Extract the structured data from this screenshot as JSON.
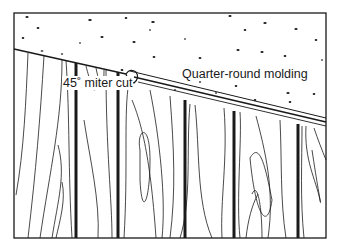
{
  "diagram": {
    "labels": {
      "miter": "45˚ miter cut",
      "molding": "Quarter-round molding"
    },
    "colors": {
      "ink": "#1a1a1a",
      "background": "#ffffff"
    }
  }
}
